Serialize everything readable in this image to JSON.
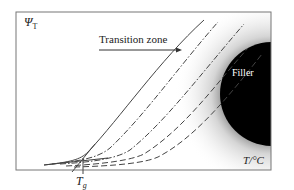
{
  "diagram": {
    "y_axis_label": "Ψ",
    "y_axis_subscript": "T",
    "x_axis_label": "T/°C",
    "annotation": "Transition zone",
    "filler_label": "Filler",
    "tg_label": "T",
    "tg_subscript": "g",
    "colors": {
      "frame": "#777777",
      "curve": "#444444",
      "filler": "#000000",
      "background": "#ffffff"
    },
    "curves": [
      {
        "name": "solid",
        "style": "solid"
      },
      {
        "name": "dash-dot-1",
        "style": "dash-dot"
      },
      {
        "name": "dash-dot-2",
        "style": "dash-dot"
      },
      {
        "name": "dashed-1",
        "style": "dashed"
      },
      {
        "name": "dashed-2",
        "style": "dashed"
      }
    ]
  }
}
